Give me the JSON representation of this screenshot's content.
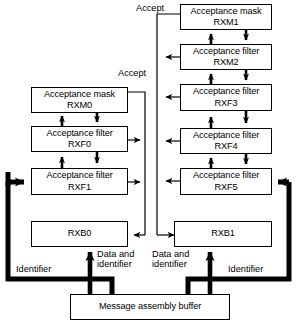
{
  "diagram": {
    "colors": {
      "stroke": "#000000",
      "fill": "#ffffff",
      "thick_stroke": "#000000"
    },
    "left_column": {
      "accept_label": "Accept",
      "boxes": [
        {
          "id": "rxm0",
          "line1": "Acceptance mask",
          "line2": "RXM0"
        },
        {
          "id": "rxf0",
          "line1": "Acceptance filter",
          "line2": "RXF0"
        },
        {
          "id": "rxf1",
          "line1": "Acceptance filter",
          "line2": "RXF1"
        }
      ],
      "buffer": {
        "id": "rxb0",
        "line1": "RXB0",
        "line2": ""
      },
      "identifier_label": "Identifier",
      "data_label_line1": "Data and",
      "data_label_line2": "identifier"
    },
    "right_column": {
      "accept_label": "Accept",
      "boxes": [
        {
          "id": "rxm1",
          "line1": "Acceptance mask",
          "line2": "RXM1"
        },
        {
          "id": "rxm2",
          "line1": "Acceptance filter",
          "line2": "RXM2"
        },
        {
          "id": "rxf3",
          "line1": "Acceptance filter",
          "line2": "RXF3"
        },
        {
          "id": "rxf4",
          "line1": "Acceptance filter",
          "line2": "RXF4"
        },
        {
          "id": "rxf5",
          "line1": "Acceptance filter",
          "line2": "RXF5"
        }
      ],
      "buffer": {
        "id": "rxb1",
        "line1": "RXB1",
        "line2": ""
      },
      "identifier_label": "Identifier",
      "data_label_line1": "Data and",
      "data_label_line2": "identifier"
    },
    "bottom": {
      "buffer_label": "Message assembly buffer"
    }
  }
}
